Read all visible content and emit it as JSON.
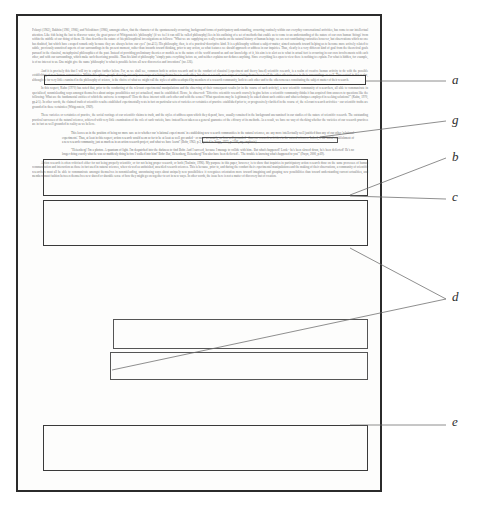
{
  "document": {
    "type": "scanned-academic-page",
    "page_border_color": "#2b2b2b",
    "body_text_color": "#6e6e6e",
    "annotation_color": "#2e2e2e"
  },
  "paragraphs": {
    "p1": "Polanyi (1962), Bakhtin (1981, 1986), and Voloshinov (1986), amongst others, that the character of the spontaneously occurring, background forms of participatory understanding, occurring routinely within our everyday conversational activities, has come to our intellectual attention. Like fish being the last to discover water, the great power of Wittgenstein's 'philosophy' (if we feel it can still be called philosophy) lies in his outlining of a set of methods that enable us to come to an understanding of the nature of our own human 'doings' from within the middle of our doing of them. He thus describes the nature of his philosophical investigations as follows: \"What we are supplying are really remarks on the natural history of human beings; we are not contributing curiosities however, but observations which no one has doubted, but which have escaped remark only because they are always before our eyes\" (no.415). His philosophy, then, is of a practical-descriptive kind. It is a philosophy without a subject-matter, aimed outwards toward helping us to become more actively related to subtle, previously unnoticed aspects of our surroundings in the present moment, rather than inwards toward thinking, prior to any action, as what features we should approach or address in our inquiries. Thus, clearly is a very different kind of goal from the theoretical goals pursued in the classical, metaphysical philosophies of the past. Instead of providing preliminary theories or models as to the nature of the world around us and our knowledge of it, his aim is to alert us to what in actual fact is occurring in our own involvements with each other, and with our surroundings, which make such theorizing possible. Thus his kind of philosophy \"simply puts everything before us, and neither explains nor deduces anything. Since everything lies open to view there is nothing to explain. For what is hidden, for example, is of no interest to us. One might give the name 'philosophy' to what is possible before all new discoveries and inventions\" (no.126).",
    "p2": "And it is precisely this that I will try to explore further below. For, as we shall see, common both to action research and to the conduct of classical (experiment and theory based) scientific research, is a realm of creative human activity to do with the possible establishing of new human communities. Within this sphere, people develop, not only new ways of relating themselves to each other, but also as a result, new ways of relating themselves to all the other otherernesses in their surroundings as well. Thus central in this realm, although so far very little examined in the philosophy of science, is the choice of what we might call the styles of address adopted by members of a research community, both to each other and to the otherernesses constituting the subject matter of their research.",
    "p3": "In this respect, Kuhn (1970) has noted that, prior to the conducting of the relevant experimental manipulations and the observing of their consequent results (or in the course of such activity), a new scientific community of researchers, all able to communicate in specialized, nonmisleading ways amongst themselves about unique possibilities not yet actualized, must be established. Hence, he observed: \"Effective scientific research scarcely begins before a scientific community thinks it has acquired firm answers to questions like the following: What are the fundamental entities of which the universe is composed? How do these interact with each other and with the senses? What questions may be legitimately be asked about such entities and what techniques employed in seeking solutions?\" (Kuhn, 1970, pp.4-5). In other words, the claimed truth of scientific results established experimentally rests in fact on particular sets of varieties or certainties of practice established prior to, or progressively clarified in the course of, the relevant research activities - our scientific truths are grounded in these certainties (Wittgenstein, 1969).",
    "p4": "These varieties or certainties of practice, the social rootings of our scientific claims to truth, and the styles of address upon which they depend, have, usually remained in the background unexamined in our studies of the nature of scientific research. The outstanding practical successes of the natural sciences, achieved with very little examination of the role of such varietis, have instead been taken as a general guarantee of the efficacy of its methods. As a result, we have no way of checking whether the varieties of our research practices are in fact as well grounded in reality as we believe.",
    "p5": "This leaves us in the position of being no more sure as to whether our 'relational experi ments' in establishing new research communities in the natural sciences, are any more intellectually well justified than any of our other 'relational experiments'. Thus, at least in this respect, action research would seem so far to be at least as well gro unded - or more accurately, no less well grounded - than our research activities in the natural sciences. Indeed, if the initial establishment of a new research community, just as much as in an action research project, and what we have learnt\" (Bohr, 1963; p.3, quoted in Stapp, 1972, p.1106, my emphasis).",
    "p6": "\"Heisenberg! I'm a photon. A quantum of light. I'm despatched into the darkness to find Bohr. And I succeed, because I manage to collide with him.. But what's happened? Look - he's been slowed down, he's been deflected! He's no longer doing exactly what he was so maddenly doing before I walked into him!' Bohr: But, Heisenberg, Heisenberg! You also have been deflected!.. 'The trouble is knowing what's happened to you'\" (Frayn, 2000, p.69).",
    "p7": "Action research is often criticised either for not being properly scientific, or for not being proper research, or both (Toulmin, 1996). My purpose in this paper, however, is to show that inquiries in participatory action research draw on the same processes of human communication and interaction as those in fact used in natural sciences, when viewed as unfinished, unsettled research sciences. This is because, prior to, and during the conduct their experimental manipulations and the making of their observations, a community of scientific researchers must all be able to communicate amongst themselves in nonmisleading, unconfusing ways about uniquely new possibilities: it recognizes orientation more toward imagining and grasping new possibilities than toward understanding current actualities, and members must fashion between themselves new shared or sharable sense of how they might go on together to act in new ways. In other words, the issue here is not a matter of discovery but of creation."
  },
  "annotations": {
    "markers": [
      {
        "id": "a",
        "label": "a",
        "x": 452,
        "y": 80,
        "target": "boxed-sentence-wittgenstein-quote"
      },
      {
        "id": "g",
        "label": "g",
        "x": 452,
        "y": 120,
        "target": "boxed-phrase-everything-lies-open"
      },
      {
        "id": "b",
        "label": "b",
        "x": 452,
        "y": 157,
        "target": "boxed-paragraph-creative-human-activity"
      },
      {
        "id": "c",
        "label": "c",
        "x": 452,
        "y": 197,
        "target": "boxed-paragraph-kuhn"
      },
      {
        "id": "d",
        "label": "d",
        "x": 452,
        "y": 297,
        "target": "boxed-quote-blocks"
      },
      {
        "id": "e",
        "label": "e",
        "x": 452,
        "y": 422,
        "target": "boxed-paragraph-action-research"
      }
    ],
    "boxes": [
      {
        "id": "box-a",
        "left": 44,
        "top": 75,
        "width": 322,
        "height": 10
      },
      {
        "id": "box-g",
        "left": 201,
        "top": 136,
        "width": 135,
        "height": 5
      },
      {
        "id": "box-b",
        "left": 43,
        "top": 158,
        "width": 325,
        "height": 37
      },
      {
        "id": "box-c",
        "left": 43,
        "top": 199,
        "width": 325,
        "height": 45
      },
      {
        "id": "box-d1",
        "left": 112,
        "top": 318,
        "width": 255,
        "height": 30
      },
      {
        "id": "box-d2",
        "left": 109,
        "top": 350,
        "width": 259,
        "height": 28
      },
      {
        "id": "box-e",
        "left": 43,
        "top": 424,
        "width": 325,
        "height": 45
      }
    ]
  }
}
